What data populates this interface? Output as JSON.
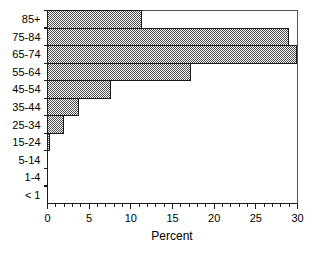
{
  "chart_data": {
    "type": "bar",
    "orientation": "horizontal",
    "title": "",
    "xlabel": "Percent",
    "ylabel": "",
    "categories": [
      "< 1",
      "1-4",
      "5-14",
      "15-24",
      "25-34",
      "35-44",
      "45-54",
      "55-64",
      "65-74",
      "75-84",
      "85+"
    ],
    "values": [
      0,
      0,
      0,
      0.2,
      1.9,
      3.7,
      7.6,
      17.2,
      29.9,
      28.9,
      11.3
    ],
    "xlim": [
      0,
      30
    ],
    "xticks": [
      0,
      5,
      10,
      15,
      20,
      25,
      30
    ],
    "xtick_labels": [
      "0",
      "5",
      "10",
      "15",
      "20",
      "25",
      "30"
    ],
    "xminor_tick_step": 1,
    "grid": false,
    "legend": false,
    "bar_fill": "#808080",
    "bar_fill_pattern": "checkerboard-dither",
    "bar_edge_color": "#1a1a1a",
    "axis_color": "#1a1a1a"
  }
}
